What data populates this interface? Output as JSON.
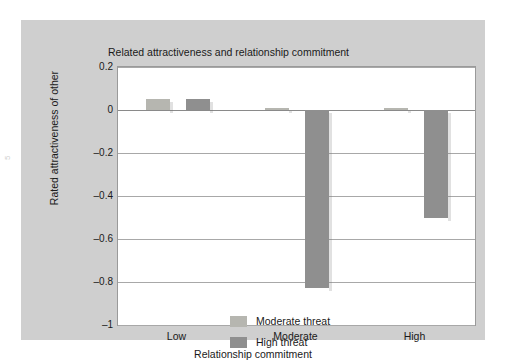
{
  "figure": {
    "title": "Related attractiveness and relationship commitment",
    "page_mark": "5"
  },
  "colors": {
    "frame": "#cfcfcf",
    "plot_bg": "#ffffff",
    "grid": "#a8a8a8",
    "moderate_threat": "#b6b6b0",
    "high_threat": "#8f8f8f",
    "text": "#1a1a1a"
  },
  "chart_data": {
    "type": "bar",
    "title": "Related attractiveness and relationship commitment",
    "xlabel": "Relationship commitment",
    "ylabel": "Rated attractiveness of other",
    "categories": [
      "Low",
      "Moderate",
      "High"
    ],
    "series": [
      {
        "name": "Moderate threat",
        "color": "#b6b6b0",
        "values": [
          0.05,
          0.01,
          0.01
        ]
      },
      {
        "name": "High threat",
        "color": "#8f8f8f",
        "values": [
          0.05,
          -0.83,
          -0.5
        ]
      }
    ],
    "ylim": [
      -1,
      0.2
    ],
    "yticks": [
      0.2,
      0,
      -0.2,
      -0.4,
      -0.6,
      -0.8,
      -1
    ],
    "ytick_labels": [
      "0.2",
      "0",
      "–0.2",
      "–0.4",
      "–0.6",
      "–0.8",
      "–1"
    ],
    "grid": true,
    "legend_position": "inside-lower-left"
  }
}
